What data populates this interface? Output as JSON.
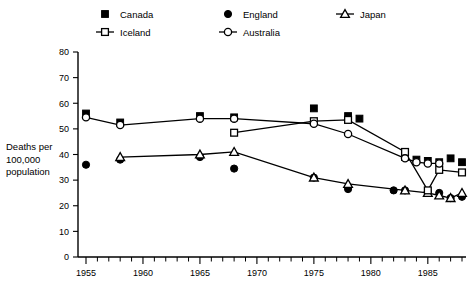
{
  "chart_data": {
    "type": "line",
    "title": "",
    "xlabel": "",
    "ylabel": "Deaths per 100,000 population",
    "ylabel_lines": [
      "Deaths per",
      "100,000",
      "population"
    ],
    "xlim": [
      1954,
      1989
    ],
    "ylim": [
      0,
      80
    ],
    "grid": false,
    "legend_position": "top",
    "y_ticks": [
      0,
      10,
      20,
      30,
      40,
      50,
      60,
      70,
      80
    ],
    "y_tick_labels": [
      "0",
      "10",
      "20",
      "30",
      "40",
      "50",
      "60",
      "70",
      "80"
    ],
    "x_ticks": [
      1955,
      1960,
      1965,
      1970,
      1975,
      1980,
      1985
    ],
    "x_tick_labels": [
      "1955",
      "1960",
      "1965",
      "1970",
      "1975",
      "1980",
      "1985"
    ],
    "x_minor_step": 1,
    "series": [
      {
        "name": "Canada",
        "marker": "filled-square",
        "line": false,
        "x": [
          1955,
          1958,
          1965,
          1968,
          1975,
          1978,
          1979,
          1983,
          1984,
          1985,
          1986,
          1987,
          1988
        ],
        "values": [
          56,
          52.5,
          55,
          54.5,
          58,
          55,
          54,
          39,
          38,
          37.5,
          37,
          38.5,
          37
        ]
      },
      {
        "name": "England",
        "marker": "filled-circle",
        "line": false,
        "x": [
          1955,
          1958,
          1965,
          1968,
          1975,
          1978,
          1982,
          1983,
          1985,
          1986,
          1987,
          1988
        ],
        "values": [
          36,
          38,
          39,
          34.5,
          31,
          26.5,
          26,
          26,
          25.5,
          25,
          23,
          23.5
        ]
      },
      {
        "name": "Japan",
        "marker": "open-triangle",
        "line": true,
        "x": [
          1958,
          1965,
          1968,
          1975,
          1978,
          1983,
          1985,
          1986,
          1987,
          1988
        ],
        "values": [
          39,
          40,
          41,
          31,
          28.5,
          26,
          25,
          24,
          23,
          25
        ]
      },
      {
        "name": "Iceland",
        "marker": "open-square",
        "line": true,
        "x": [
          1968,
          1975,
          1978,
          1983,
          1985,
          1986,
          1988
        ],
        "values": [
          48.5,
          53,
          53.5,
          41,
          26,
          34,
          33
        ]
      },
      {
        "name": "Australia",
        "marker": "open-circle",
        "line": true,
        "x": [
          1955,
          1958,
          1965,
          1968,
          1975,
          1978,
          1983,
          1984,
          1985,
          1986
        ],
        "values": [
          54.5,
          51.5,
          54,
          54,
          52,
          48,
          38.5,
          37,
          36.5,
          36.5
        ]
      }
    ]
  },
  "legend": {
    "entries": [
      {
        "label": "Canada",
        "marker": "filled-square",
        "line": false
      },
      {
        "label": "England",
        "marker": "filled-circle",
        "line": false
      },
      {
        "label": "Japan",
        "marker": "open-triangle",
        "line": true
      },
      {
        "label": "Iceland",
        "marker": "open-square",
        "line": true
      },
      {
        "label": "Australia",
        "marker": "open-circle",
        "line": true
      }
    ]
  }
}
